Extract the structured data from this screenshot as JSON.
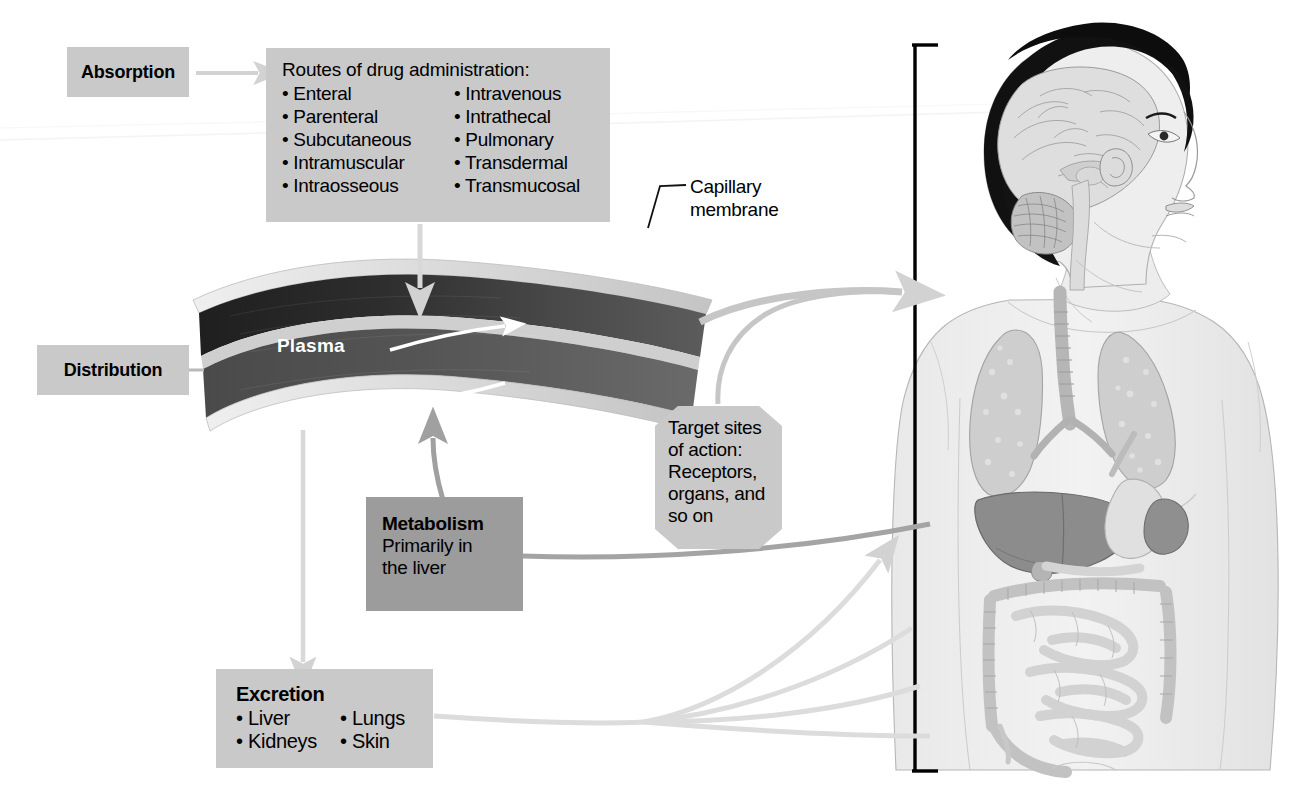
{
  "diagram": {
    "absorption": {
      "label": "Absorption"
    },
    "routes": {
      "header": "Routes of drug administration:",
      "column_left": [
        "• Enteral",
        "• Parenteral",
        "• Subcutaneous",
        "• Intramuscular",
        "• Intraosseous"
      ],
      "column_right": [
        "• Intravenous",
        "• Intrathecal",
        "• Pulmonary",
        "• Transdermal",
        "• Transmucosal"
      ]
    },
    "capillary": {
      "label_line1": "Capillary",
      "label_line2": "membrane"
    },
    "distribution": {
      "label": "Distribution"
    },
    "plasma": {
      "label": "Plasma"
    },
    "target": {
      "line1": "Target sites",
      "line2": "of action:",
      "line3": "Receptors,",
      "line4": "organs, and",
      "line5": "so on"
    },
    "metabolism": {
      "title": "Metabolism",
      "line1": "Primarily in",
      "line2": "the liver"
    },
    "excretion": {
      "title": "Excretion",
      "column_left": [
        "• Liver",
        "• Kidneys"
      ],
      "column_right": [
        "• Lungs",
        "• Skin"
      ]
    },
    "body_figure": {
      "description": "Anatomical illustration of a human upper body in three-quarter view showing brain, lungs, liver, stomach, spleen, and intestines",
      "organs": [
        "brain",
        "lungs",
        "trachea",
        "liver",
        "stomach",
        "spleen",
        "large intestine",
        "small intestine"
      ]
    },
    "colors": {
      "box_light": "#c9c9c9",
      "box_dark": "#9c9c9c",
      "arrow_light": "#d2d2d2",
      "arrow_mid": "#9c9c9c",
      "vessel_dark": "#2b2b2b",
      "vessel_mid": "#4f4f4f",
      "membrane": "#d8d8d8",
      "bracket": "#000000"
    }
  }
}
